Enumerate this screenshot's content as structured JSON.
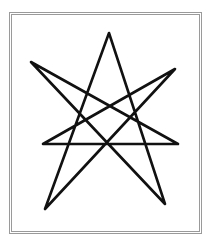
{
  "figure": {
    "stroke_color": "#111111",
    "frame_color": "#9a9a9a",
    "points": {
      "top": [
        109,
        33
      ],
      "right_upper": [
        175,
        69
      ],
      "right_middle": [
        178,
        144
      ],
      "bottom_right": [
        165,
        204
      ],
      "bottom_left": [
        45,
        209
      ],
      "left_middle": [
        43,
        144
      ],
      "left_upper": [
        31,
        62
      ]
    },
    "path_order": [
      "top",
      "bottom_right",
      "left_upper",
      "right_middle",
      "left_middle",
      "right_upper",
      "bottom_left",
      "top"
    ]
  }
}
